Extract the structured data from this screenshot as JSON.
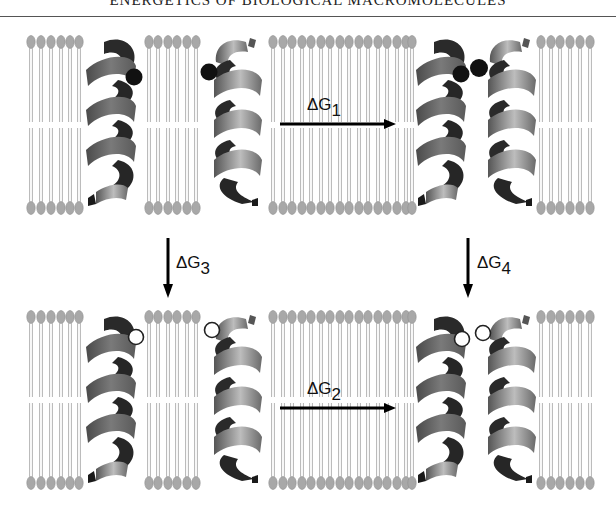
{
  "header": {
    "title": "ENERGETICS OF BIOLOGICAL MACROMOLECULES"
  },
  "figure": {
    "top_panel": {
      "state": "separated-helices-charged",
      "residue_style": "filled-black-circle",
      "lipid_columns": [
        6,
        6,
        16,
        6
      ]
    },
    "bottom_panel": {
      "state": "separated-helices-neutral",
      "residue_style": "open-white-circle",
      "lipid_columns": [
        6,
        6,
        16,
        6
      ]
    },
    "arrows": [
      {
        "id": "dg1",
        "symbol": "ΔG",
        "subscript": "1",
        "direction": "right"
      },
      {
        "id": "dg2",
        "symbol": "ΔG",
        "subscript": "2",
        "direction": "right"
      },
      {
        "id": "dg3",
        "symbol": "ΔG",
        "subscript": "3",
        "direction": "down"
      },
      {
        "id": "dg4",
        "symbol": "ΔG",
        "subscript": "4",
        "direction": "down"
      }
    ],
    "colors": {
      "lipid_head": "#a8a8a8",
      "lipid_tail": "#b4b4b4",
      "helix_dark": "#2a2a2a",
      "helix_mid": "#6e6e6e",
      "helix_light": "#bdbdbd",
      "residue_filled": "#111111",
      "arrow": "#000000"
    }
  }
}
